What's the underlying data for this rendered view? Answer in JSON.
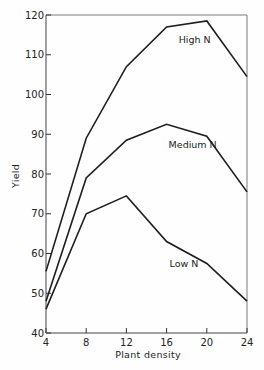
{
  "chart_data": {
    "type": "line",
    "title": "",
    "xlabel": "Plant density",
    "ylabel": "Yield",
    "x": [
      4,
      8,
      12,
      16,
      20,
      24
    ],
    "xticks": [
      4,
      8,
      12,
      16,
      20,
      24
    ],
    "yticks": [
      40,
      50,
      60,
      70,
      80,
      90,
      100,
      110,
      120
    ],
    "xlim": [
      4,
      24
    ],
    "ylim": [
      40,
      120
    ],
    "grid": false,
    "legend_position": "inline labels",
    "series": [
      {
        "name": "High N",
        "values": [
          55.5,
          89,
          107,
          117,
          118.5,
          104.5
        ]
      },
      {
        "name": "Medium N",
        "values": [
          48,
          79,
          88.5,
          92.5,
          89.5,
          75.5
        ]
      },
      {
        "name": "Low N",
        "values": [
          46,
          70,
          74.5,
          63,
          57.5,
          48
        ]
      }
    ],
    "annotations": [
      {
        "text": "High N",
        "x": 17.2,
        "y": 113
      },
      {
        "text": "Medium N",
        "x": 16.2,
        "y": 86.5
      },
      {
        "text": "Low N",
        "x": 16.3,
        "y": 56.5
      }
    ]
  }
}
